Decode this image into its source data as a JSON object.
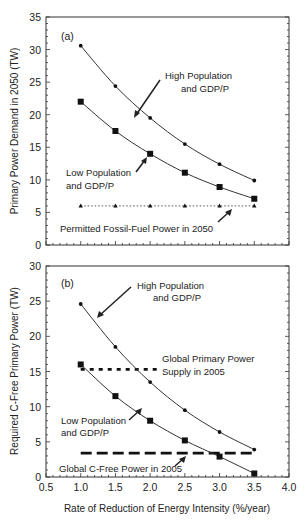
{
  "chart_data": [
    {
      "panel": "(a)",
      "type": "line",
      "title": "",
      "xlabel": "",
      "ylabel": "Primary Power Demand in 2050 (TW)",
      "x": [
        1.0,
        1.5,
        2.0,
        2.5,
        3.0,
        3.5
      ],
      "xlim": [
        0.5,
        4.0
      ],
      "ylim": [
        0,
        35
      ],
      "yticks": [
        0,
        5,
        10,
        15,
        20,
        25,
        30,
        35
      ],
      "grid": false,
      "series": [
        {
          "name": "High Population and GDP/P",
          "marker": "diamond",
          "style": "solid",
          "values": [
            30.6,
            24.4,
            19.5,
            15.5,
            12.4,
            9.9
          ]
        },
        {
          "name": "Low Population and GDP/P",
          "marker": "square",
          "style": "solid",
          "values": [
            22.0,
            17.5,
            14.0,
            11.1,
            8.9,
            7.1
          ]
        },
        {
          "name": "Permitted Fossil-Fuel Power in 2050",
          "marker": "triangle",
          "style": "dotted",
          "values": [
            6.0,
            6.0,
            6.0,
            6.0,
            6.0,
            6.0
          ]
        }
      ],
      "annotations": [
        {
          "text": [
            "High Population",
            "and GDP/P"
          ]
        },
        {
          "text": [
            "Low Population",
            "and GDP/P"
          ]
        },
        {
          "text": [
            "Permitted Fossil-Fuel Power in 2050"
          ]
        }
      ]
    },
    {
      "panel": "(b)",
      "type": "line",
      "title": "",
      "xlabel": "Rate of Reduction of Energy Intensity (%/year)",
      "ylabel": "Required C-Free Primary Power (TW)",
      "x": [
        1.0,
        1.5,
        2.0,
        2.5,
        3.0,
        3.5
      ],
      "xticks": [
        "0.5",
        "1.0",
        "1.5",
        "2.0",
        "2.5",
        "3.0",
        "3.5",
        "4.0"
      ],
      "xlim": [
        0.5,
        4.0
      ],
      "ylim": [
        0,
        30
      ],
      "yticks": [
        0,
        5,
        10,
        15,
        20,
        25,
        30
      ],
      "grid": false,
      "series": [
        {
          "name": "High Population and GDP/P",
          "marker": "diamond",
          "style": "solid",
          "values": [
            24.6,
            18.5,
            13.5,
            9.5,
            6.4,
            3.9
          ]
        },
        {
          "name": "Low Population and GDP/P",
          "marker": "square",
          "style": "solid",
          "values": [
            16.0,
            11.5,
            8.0,
            5.2,
            2.9,
            0.5
          ]
        }
      ],
      "reference_lines": [
        {
          "name": "Global Primary Power Supply in 2005",
          "value": 15.3,
          "x_range": [
            1.0,
            2.1
          ],
          "style": "dotted-thick"
        },
        {
          "name": "Global C-Free Power in 2005",
          "value": 3.4,
          "x_range": [
            1.0,
            3.5
          ],
          "style": "dashed-thick"
        }
      ],
      "annotations": [
        {
          "text": [
            "High Population",
            "and GDP/P"
          ]
        },
        {
          "text": [
            "Global Primary Power",
            "Supply in 2005"
          ]
        },
        {
          "text": [
            "Low Population",
            "and GDP/P"
          ]
        },
        {
          "text": [
            "Global C-Free Power in 2005"
          ]
        }
      ]
    }
  ]
}
